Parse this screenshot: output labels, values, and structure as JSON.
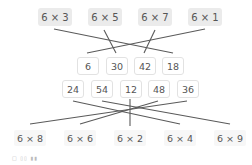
{
  "top_expressions": [
    "6 × 3",
    "6 × 5",
    "6 × 7",
    "6 × 1"
  ],
  "products_row1": [
    "6",
    "30",
    "42",
    "18"
  ],
  "products_row2": [
    "24",
    "54",
    "12",
    "48",
    "36"
  ],
  "bottom_expressions": [
    "6 × 8",
    "6 × 6",
    "6 × 2",
    "6 × 4",
    "6 × 9"
  ],
  "connections_top": [
    {
      "from": "6 × 3",
      "to": "18"
    },
    {
      "from": "6 × 5",
      "to": "30"
    },
    {
      "from": "6 × 7",
      "to": "42"
    },
    {
      "from": "6 × 1",
      "to": "6"
    }
  ],
  "connections_bottom": [
    {
      "from": "24",
      "to": "6 × 4"
    },
    {
      "from": "54",
      "to": "6 × 9"
    },
    {
      "from": "12",
      "to": "6 × 2"
    },
    {
      "from": "48",
      "to": "6 × 8"
    },
    {
      "from": "36",
      "to": "6 × 6"
    }
  ],
  "watermark": "□ ▯▯ ▮▮",
  "colors": {
    "line": "#555555",
    "top_box_bg": "#ebebeb",
    "num_border": "#e2e2e2"
  }
}
